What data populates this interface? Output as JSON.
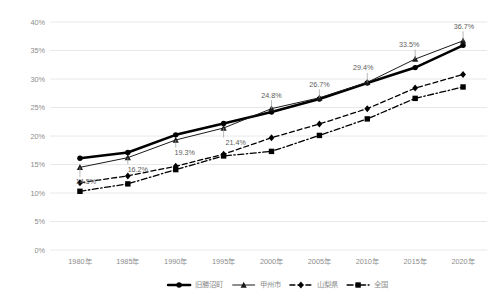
{
  "chart_data": {
    "type": "line",
    "title": "",
    "subtitle": "",
    "xlabel": "",
    "ylabel": "",
    "grid": true,
    "legend_position": "bottom",
    "ylim": [
      0,
      40
    ],
    "ytick_values": [
      0,
      5,
      10,
      15,
      20,
      25,
      30,
      35,
      40
    ],
    "ytick_labels": [
      "0%",
      "5%",
      "10%",
      "15%",
      "20%",
      "25%",
      "30%",
      "35%",
      "40%"
    ],
    "categories": [
      "1980年",
      "1985年",
      "1990年",
      "1995年",
      "2000年",
      "2005年",
      "2010年",
      "2015年",
      "2020年"
    ],
    "series": [
      {
        "name": "旧勝沼町",
        "values": [
          16.1,
          17.1,
          20.2,
          22.2,
          24.2,
          26.5,
          29.3,
          32.0,
          35.9
        ],
        "style": "solid-thick",
        "marker": "circle",
        "color": "#000000",
        "labels": []
      },
      {
        "name": "甲州市",
        "values": [
          14.5,
          16.2,
          19.3,
          21.4,
          24.8,
          26.7,
          29.4,
          33.5,
          36.7
        ],
        "style": "solid-thin",
        "marker": "triangle",
        "color": "#1a1a1a",
        "labels": [
          "14.5%",
          "16.2%",
          "19.3%",
          "21.4%",
          "24.8%",
          "26.7%",
          "29.4%",
          "33.5%",
          "36.7%"
        ]
      },
      {
        "name": "山梨県",
        "values": [
          11.8,
          13.0,
          14.7,
          16.8,
          19.7,
          22.1,
          24.8,
          28.4,
          30.8
        ],
        "style": "dashed",
        "marker": "diamond",
        "color": "#000000",
        "labels": []
      },
      {
        "name": "全国",
        "values": [
          10.3,
          11.6,
          14.1,
          16.5,
          17.3,
          20.1,
          23.0,
          26.6,
          28.6
        ],
        "style": "dash-dot",
        "marker": "square",
        "color": "#000000",
        "labels": []
      }
    ],
    "colors": {
      "gridline": "#e2e2e2",
      "tick_label": "#8c8c8c",
      "data_label": "#5e5e5e",
      "background": "#ffffff",
      "series_line": "#000000"
    }
  }
}
